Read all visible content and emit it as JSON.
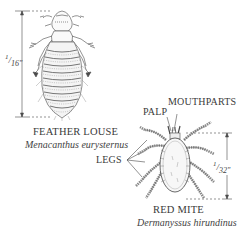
{
  "feather_louse": {
    "common_name": "FEATHER LOUSE",
    "scientific_name": "Menacanthus eurysternus",
    "scale_label": "1/16\"",
    "scale_num": "1",
    "scale_den": "16\""
  },
  "red_mite": {
    "common_name": "RED MITE",
    "scientific_name": "Dermanyssus hirundinus",
    "scale_label": "1/32\"",
    "scale_num": "1",
    "scale_den": "32\"",
    "callouts": {
      "palp": "PALP",
      "mouthparts": "MOUTHPARTS",
      "legs": "LEGS"
    }
  },
  "colors": {
    "ink": "#3a3a3a",
    "background": "#ffffff"
  }
}
